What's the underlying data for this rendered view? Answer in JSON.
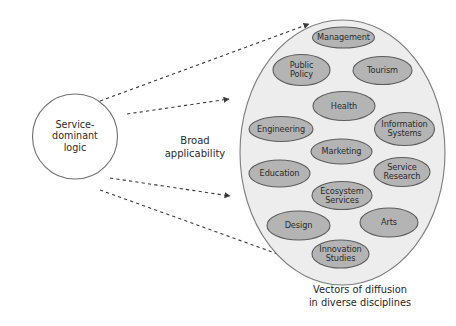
{
  "diagram": {
    "type": "concept-diagram",
    "source_node": {
      "label": "Service-\ndominant\nlogic",
      "shape": "circle",
      "fill": "#ffffff",
      "stroke": "#6f6f6f",
      "cx": 75,
      "cy": 136.5,
      "r": 42.5
    },
    "middle_label": {
      "text": "Broad\napplicability",
      "x": 195,
      "y": 147
    },
    "target_container": {
      "label": "diverse-disciplines-ellipse",
      "shape": "ellipse",
      "fill": "#ededed",
      "stroke": "#7d7d7d",
      "cx": 342.5,
      "cy": 152.5,
      "rx": 102.5,
      "ry": 132.5
    },
    "caption": {
      "text": "Vectors of diffusion\nin diverse disciplines",
      "x": 360,
      "y": 297
    },
    "arrows": [
      {
        "name": "arrow-top",
        "x1": 100,
        "y1": 101,
        "x2": 309,
        "y2": 24,
        "style": "dashed",
        "color": "#3a3a3a"
      },
      {
        "name": "arrow-middle",
        "x1": 127,
        "y1": 114,
        "x2": 229,
        "y2": 99,
        "style": "dashed",
        "color": "#3a3a3a"
      },
      {
        "name": "arrow-lower-middle",
        "x1": 110,
        "y1": 178,
        "x2": 230,
        "y2": 196,
        "style": "dashed",
        "color": "#3a3a3a"
      },
      {
        "name": "arrow-bottom",
        "x1": 100,
        "y1": 190,
        "x2": 300,
        "y2": 262,
        "style": "dashed",
        "color": "#3a3a3a"
      }
    ],
    "bubble_style": {
      "fill": "#b4b4b4",
      "stroke": "#5c5c5c"
    },
    "bubbles": [
      {
        "name": "management",
        "label": "Management",
        "cx": 343.5,
        "cy": 37.5,
        "rx": 31,
        "ry": 10.5
      },
      {
        "name": "public-policy",
        "label": "Public\nPolicy",
        "cx": 301.5,
        "cy": 70,
        "rx": 28.5,
        "ry": 15.5
      },
      {
        "name": "tourism",
        "label": "Tourism",
        "cx": 382.5,
        "cy": 70.5,
        "rx": 29.5,
        "ry": 14
      },
      {
        "name": "health",
        "label": "Health",
        "cx": 344,
        "cy": 106,
        "rx": 31,
        "ry": 14.5
      },
      {
        "name": "engineering",
        "label": "Engineering",
        "cx": 281,
        "cy": 129,
        "rx": 32,
        "ry": 12.5
      },
      {
        "name": "information-systems",
        "label": "Information\nSystems",
        "cx": 404.5,
        "cy": 129,
        "rx": 30,
        "ry": 16.5
      },
      {
        "name": "marketing",
        "label": "Marketing",
        "cx": 341.5,
        "cy": 151.5,
        "rx": 30.5,
        "ry": 12.5
      },
      {
        "name": "education",
        "label": "Education",
        "cx": 279.5,
        "cy": 173.5,
        "rx": 30.5,
        "ry": 13.5
      },
      {
        "name": "service-research",
        "label": "Service\nResearch",
        "cx": 402,
        "cy": 172,
        "rx": 28,
        "ry": 14.5
      },
      {
        "name": "ecosystem-services",
        "label": "Ecosystem\nServices",
        "cx": 342,
        "cy": 195.5,
        "rx": 30,
        "ry": 14
      },
      {
        "name": "design",
        "label": "Design",
        "cx": 298.5,
        "cy": 225.5,
        "rx": 31.5,
        "ry": 14.5
      },
      {
        "name": "arts",
        "label": "Arts",
        "cx": 389,
        "cy": 222.5,
        "rx": 29,
        "ry": 14.5
      },
      {
        "name": "innovation-studies",
        "label": "Innovation\nStudies",
        "cx": 340.5,
        "cy": 254,
        "rx": 28.5,
        "ry": 14
      }
    ]
  }
}
